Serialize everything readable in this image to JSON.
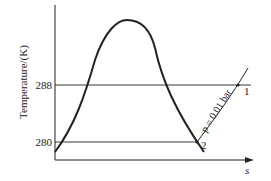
{
  "diagram": {
    "type": "T-s diagram",
    "axes": {
      "ylabel": "Temperature/(K)",
      "xlabel": "s",
      "yticks": [
        "288",
        "280"
      ]
    },
    "isotherms": [
      {
        "label": "288",
        "value": 288
      },
      {
        "label": "280",
        "value": 280
      }
    ],
    "isobar": {
      "label": "p = 0.01 bar"
    },
    "points": [
      {
        "label": "1",
        "description": "intersection of isobar with 288 K isotherm"
      },
      {
        "label": "2",
        "description": "intersection of isobar with 280 K isotherm on saturated vapor line"
      }
    ],
    "colors": {
      "line": "#222222",
      "background": "#ffffff"
    }
  }
}
